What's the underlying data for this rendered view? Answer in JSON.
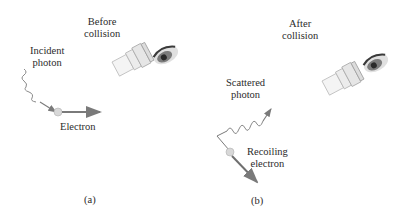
{
  "panel_a": {
    "title_line1": "Before",
    "title_line2": "collision",
    "photon_label_line1": "Incident",
    "photon_label_line2": "photon",
    "electron_label": "Electron",
    "caption": "(a)"
  },
  "panel_b": {
    "title_line1": "After",
    "title_line2": "collision",
    "photon_label_line1": "Scattered",
    "photon_label_line2": "photon",
    "electron_label_line1": "Recoiling",
    "electron_label_line2": "electron",
    "caption": "(b)"
  },
  "colors": {
    "arrow": "#7a7a7a",
    "electron_fill": "#d8d8d8",
    "text": "#2b2b2b"
  }
}
